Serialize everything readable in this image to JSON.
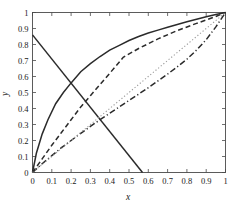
{
  "chart_data": {
    "type": "line",
    "title": "",
    "xlabel": "x",
    "ylabel": "y",
    "xlim": [
      0,
      1
    ],
    "ylim": [
      0,
      1
    ],
    "grid": false,
    "legend": "none",
    "xticks": [
      "0",
      "0.1",
      "0.2",
      "0.3",
      "0.4",
      "0.5",
      "0.6",
      "0.7",
      "0.8",
      "0.9",
      "1"
    ],
    "yticks": [
      "0",
      "0.1",
      "0.2",
      "0.3",
      "0.4",
      "0.5",
      "0.6",
      "0.7",
      "0.8",
      "0.9",
      "1"
    ],
    "xtick_values": [
      0,
      0.1,
      0.2,
      0.3,
      0.4,
      0.5,
      0.6,
      0.7,
      0.8,
      0.9,
      1
    ],
    "ytick_values": [
      0,
      0.1,
      0.2,
      0.3,
      0.4,
      0.5,
      0.6,
      0.7,
      0.8,
      0.9,
      1
    ],
    "series": [
      {
        "name": "concave-rising-curve",
        "style": "solid",
        "color": "#2b2b2b",
        "x": [
          0,
          0.02,
          0.05,
          0.08,
          0.12,
          0.16,
          0.2,
          0.25,
          0.3,
          0.35,
          0.4,
          0.45,
          0.5,
          0.55,
          0.6,
          0.65,
          0.7,
          0.75,
          0.8,
          0.85,
          0.9,
          0.95,
          1
        ],
        "y": [
          0,
          0.12,
          0.24,
          0.33,
          0.43,
          0.5,
          0.56,
          0.63,
          0.68,
          0.725,
          0.765,
          0.795,
          0.825,
          0.85,
          0.872,
          0.89,
          0.908,
          0.925,
          0.942,
          0.958,
          0.973,
          0.987,
          1
        ]
      },
      {
        "name": "descending-line",
        "style": "solid",
        "color": "#2b2b2b",
        "x": [
          0,
          0.57
        ],
        "y": [
          0.86,
          0
        ]
      },
      {
        "name": "dashed-curve",
        "style": "dashed",
        "color": "#2b2b2b",
        "x": [
          0,
          0.05,
          0.1,
          0.15,
          0.2,
          0.25,
          0.3,
          0.35,
          0.4,
          0.45,
          0.47,
          0.55,
          0.65,
          0.75,
          0.85,
          0.95,
          1
        ],
        "y": [
          0,
          0.085,
          0.17,
          0.25,
          0.33,
          0.41,
          0.48,
          0.55,
          0.62,
          0.69,
          0.72,
          0.775,
          0.835,
          0.887,
          0.932,
          0.975,
          1
        ]
      },
      {
        "name": "dash-dot-curve",
        "style": "dashdot",
        "color": "#2b2b2b",
        "x": [
          0,
          0.05,
          0.1,
          0.15,
          0.2,
          0.25,
          0.3,
          0.35,
          0.4,
          0.45,
          0.5,
          0.55,
          0.6,
          0.65,
          0.7,
          0.75,
          0.8,
          0.85,
          0.9,
          0.95,
          1
        ],
        "y": [
          0,
          0.055,
          0.105,
          0.155,
          0.2,
          0.245,
          0.288,
          0.33,
          0.37,
          0.41,
          0.45,
          0.49,
          0.53,
          0.572,
          0.615,
          0.66,
          0.708,
          0.765,
          0.83,
          0.91,
          1
        ]
      },
      {
        "name": "dotted-diagonal",
        "style": "dotted",
        "color": "#9a9a9a",
        "x": [
          0,
          1
        ],
        "y": [
          0,
          1
        ]
      }
    ]
  },
  "axes": {
    "x_title": "x",
    "y_title": "y"
  }
}
